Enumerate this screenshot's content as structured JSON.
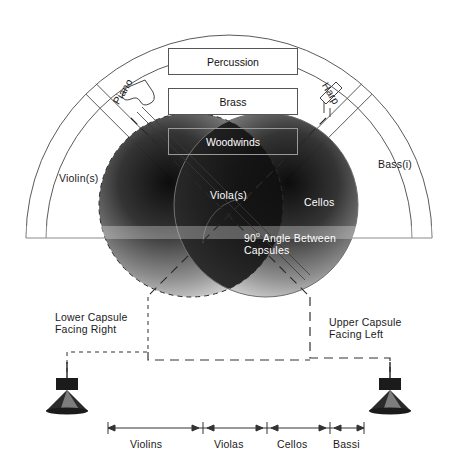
{
  "diagram": {
    "sections": {
      "percussion": "Percussion",
      "brass": "Brass",
      "woodwinds": "Woodwinds",
      "piano": "Piano",
      "harp": "Harp"
    },
    "strings": {
      "violins_arc": "Violin(s)",
      "violas_arc": "Viola(s)",
      "cellos_arc": "Cellos",
      "bassi_arc": "Bass(i)"
    },
    "annotations": {
      "angle_line1_num": "90",
      "angle_line1_deg": "o",
      "angle_line1_rest": " Angle Between",
      "angle_line2": "Capsules",
      "lower_capsule_l1": "Lower Capsule",
      "lower_capsule_l2": "Facing Right",
      "upper_capsule_l1": "Upper Capsule",
      "upper_capsule_l2": "Facing Left"
    },
    "scale": {
      "segments": [
        "Violins",
        "Violas",
        "Cellos",
        "Bassi"
      ]
    },
    "icons": {
      "piano": "grand-piano-icon",
      "harp": "harp-icon",
      "mic_left": "hanging-microphone-icon",
      "mic_right": "hanging-microphone-icon"
    },
    "colors": {
      "outline": "#555555",
      "lobe_dark": "#3a3a3a",
      "lobe_overlap": "#1c1c1c",
      "label_text": "#1a1a1a",
      "label_text_inverse": "#ffffff"
    }
  }
}
